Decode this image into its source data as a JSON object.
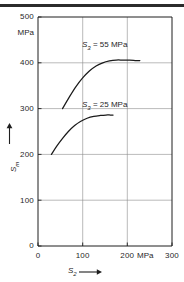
{
  "chart_data": {
    "type": "line",
    "title": "",
    "xlabel": "S2",
    "ylabel": "Sm",
    "x_unit": "MPa",
    "y_unit": "MPa",
    "xlim": [
      0,
      300
    ],
    "ylim": [
      0,
      500
    ],
    "x_ticks": [
      "0",
      "100",
      "200",
      "300"
    ],
    "x_tick_values": [
      0,
      100,
      200,
      300
    ],
    "y_ticks": [
      "0",
      "100",
      "200",
      "300",
      "400",
      "500"
    ],
    "y_tick_values": [
      0,
      100,
      200,
      300,
      400,
      500
    ],
    "grid": true,
    "legend_position": "inline-annotations",
    "series": [
      {
        "name": "S3 = 55 MPa",
        "label_prefix": "S",
        "label_sub": "3",
        "label_rest": " = 55 MPa",
        "x": [
          55,
          70,
          85,
          100,
          115,
          130,
          145,
          160,
          175,
          190,
          205,
          220,
          228
        ],
        "y": [
          300,
          325,
          348,
          367,
          382,
          393,
          400,
          404,
          406,
          406,
          406,
          405,
          405
        ]
      },
      {
        "name": "S3 = 25 MPa",
        "label_prefix": "S",
        "label_sub": "3",
        "label_rest": " = 25 MPa",
        "x": [
          30,
          42,
          55,
          68,
          82,
          95,
          110,
          125,
          140,
          152,
          162,
          168
        ],
        "y": [
          200,
          218,
          235,
          250,
          263,
          272,
          279,
          283,
          285,
          286,
          286,
          286
        ]
      }
    ],
    "annotations": [
      {
        "text": "S3 = 55 MPa",
        "x": 150,
        "y": 432
      },
      {
        "text": "S3 = 25 MPa",
        "x": 150,
        "y": 302
      }
    ]
  },
  "axes": {
    "y_unit_label": "MPa",
    "x_unit_label": "MPa",
    "y_title_symbol": "S",
    "y_title_sub": "m",
    "x_title_symbol": "S",
    "x_title_sub": "2"
  },
  "colors": {
    "curve": "#1a1a1a",
    "grid": "#8c8c8c",
    "axis": "#1f1f1f",
    "rule": "#2b2b2b",
    "background": "#ffffff"
  }
}
